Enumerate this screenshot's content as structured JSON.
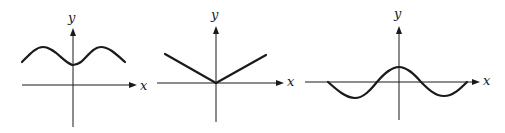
{
  "figure": {
    "panels": [
      {
        "id": "panel-1",
        "description": "Smooth even wave above the x-axis with a local minimum on the y-axis",
        "x_label": "x",
        "y_label": "y",
        "curve_type": "cosine-like wave shifted up, minimum at x=0"
      },
      {
        "id": "panel-2",
        "description": "V-shaped graph with vertex at the origin (absolute-value-like)",
        "x_label": "x",
        "y_label": "y",
        "curve_type": "piecewise linear V, vertex at origin"
      },
      {
        "id": "panel-3",
        "description": "Damped-looking oscillation crossing the x-axis with maximum on the y-axis",
        "x_label": "x",
        "y_label": "y",
        "curve_type": "cosine-like wave centered on x-axis, maximum at x=0"
      }
    ],
    "colors": {
      "ink": "#1a1a1a",
      "background": "#ffffff"
    }
  }
}
